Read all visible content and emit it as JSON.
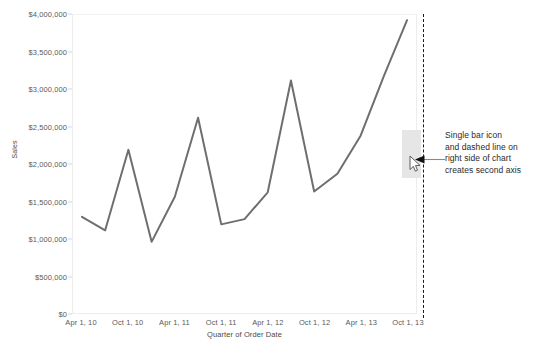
{
  "chart_data": {
    "type": "line",
    "title": "",
    "subtitle": "",
    "xlabel": "Quarter of Order Date",
    "ylabel": "Sales",
    "ylim": [
      0,
      4000000
    ],
    "xlim_labels": [
      "Apr 1, 10",
      "Oct 1, 13"
    ],
    "grid": false,
    "legend": "none",
    "y_ticks": [
      {
        "value": 0,
        "label": "$0"
      },
      {
        "value": 500000,
        "label": "$500,000"
      },
      {
        "value": 1000000,
        "label": "$1,000,000"
      },
      {
        "value": 1500000,
        "label": "$1,500,000"
      },
      {
        "value": 2000000,
        "label": "$2,000,000"
      },
      {
        "value": 2500000,
        "label": "$2,500,000"
      },
      {
        "value": 3000000,
        "label": "$3,000,000"
      },
      {
        "value": 3500000,
        "label": "$3,500,000"
      },
      {
        "value": 4000000,
        "label": "$4,000,000"
      }
    ],
    "x_ticks": [
      {
        "index": 0,
        "label": "Apr 1, 10"
      },
      {
        "index": 2,
        "label": "Oct 1, 10"
      },
      {
        "index": 4,
        "label": "Apr 1, 11"
      },
      {
        "index": 6,
        "label": "Oct 1, 11"
      },
      {
        "index": 8,
        "label": "Apr 1, 12"
      },
      {
        "index": 10,
        "label": "Oct 1, 12"
      },
      {
        "index": 12,
        "label": "Apr 1, 13"
      },
      {
        "index": 14,
        "label": "Oct 1, 13"
      }
    ],
    "series": [
      {
        "name": "Sales",
        "color": "#6e6e6e",
        "x": [
          "Apr 1, 10",
          "Jul 1, 10",
          "Oct 1, 10",
          "Jan 1, 11",
          "Apr 1, 11",
          "Jul 1, 11",
          "Oct 1, 11",
          "Jan 1, 12",
          "Apr 1, 12",
          "Jul 1, 12",
          "Oct 1, 12",
          "Jan 1, 13",
          "Apr 1, 13",
          "Jul 1, 13",
          "Oct 1, 13"
        ],
        "values": [
          1290000,
          1110000,
          2190000,
          955000,
          1560000,
          2620000,
          1190000,
          1260000,
          1620000,
          3120000,
          1630000,
          1870000,
          2380000,
          3180000,
          3930000
        ]
      }
    ]
  },
  "annotation": {
    "text": "Single bar icon\nand dashed line on\nright side of chart\ncreates second axis",
    "line1": "Single bar icon",
    "line2": "and dashed line on",
    "line3": "right side of chart",
    "line4": "creates second axis"
  },
  "markers": {
    "single_bar_label": "single bar",
    "dashed_line_label": "second axis dashed line",
    "cursor_label": "mouse cursor"
  },
  "colors": {
    "line": "#6e6e6e",
    "dashed_axis": "#1b1b1b",
    "bar": "#e6e6e6",
    "axis_text": "#5a5a5a",
    "annotation_text": "#2b2b2b",
    "plot_border": "#ededed"
  }
}
